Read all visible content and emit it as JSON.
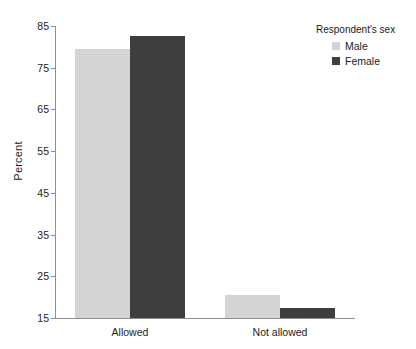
{
  "chart_data": {
    "type": "bar",
    "title": "",
    "subtitle": "",
    "xlabel": "",
    "ylabel": "Percent",
    "categories": [
      "Allowed",
      "Not allowed"
    ],
    "series": [
      {
        "name": "Male",
        "color": "#d4d4d4",
        "values": [
          79.5,
          20.5
        ]
      },
      {
        "name": "Female",
        "color": "#3e3e3e",
        "values": [
          82.5,
          17.4
        ]
      }
    ],
    "ylim": [
      15,
      85
    ],
    "yticks": [
      15,
      25,
      35,
      45,
      55,
      65,
      75,
      85
    ],
    "ytick_labels": [
      "15",
      "25",
      "35",
      "45",
      "55",
      "65",
      "75",
      "85"
    ],
    "grid": false,
    "legend": {
      "title": "Respondent's sex",
      "position": "right-top",
      "entries": [
        {
          "label": "Male",
          "color": "#d4d4d4"
        },
        {
          "label": "Female",
          "color": "#3e3e3e"
        }
      ]
    }
  },
  "axes": {
    "y_title": "Percent"
  },
  "colors": {
    "male": "#d4d4d4",
    "female": "#3e3e3e",
    "axis": "#8e8e8e",
    "text": "#1c1c1c",
    "background": "#ffffff"
  }
}
